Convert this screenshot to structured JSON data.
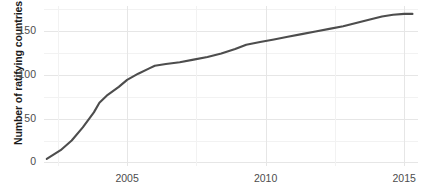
{
  "chart_data": {
    "type": "line",
    "title": "",
    "xlabel": "",
    "ylabel": "Number of ratifying countries",
    "xlim": [
      2002.0,
      2015.5
    ],
    "ylim": [
      -4,
      178
    ],
    "grid": true,
    "legend": "none",
    "line_color": "#4d4d4d",
    "x_ticks": [
      2005,
      2010,
      2015
    ],
    "x_tick_labels": [
      "2005",
      "2010",
      "2015"
    ],
    "x_minor_ticks": [
      2002.5,
      2007.5,
      2012.5
    ],
    "y_ticks": [
      0,
      50,
      100,
      150
    ],
    "y_tick_labels": [
      "0",
      "50",
      "100",
      "150"
    ],
    "y_minor_ticks": [
      25,
      75,
      125,
      175
    ],
    "series": [
      {
        "name": "Ratifying countries",
        "x": [
          2002.1,
          2002.6,
          2003.0,
          2003.4,
          2003.8,
          2004.0,
          2004.3,
          2004.7,
          2005.0,
          2005.4,
          2005.8,
          2006.0,
          2006.4,
          2006.9,
          2007.4,
          2007.9,
          2008.4,
          2008.9,
          2009.3,
          2009.8,
          2010.3,
          2010.8,
          2011.3,
          2011.8,
          2012.3,
          2012.8,
          2013.3,
          2013.8,
          2014.2,
          2014.6,
          2015.0,
          2015.3
        ],
        "y": [
          4,
          14,
          25,
          40,
          57,
          68,
          77,
          86,
          94,
          101,
          107,
          110,
          112,
          114,
          117,
          120,
          124,
          129,
          134,
          137,
          140,
          143,
          146,
          149,
          152,
          155,
          159,
          163,
          166,
          168,
          169,
          169
        ]
      }
    ]
  },
  "axis": {
    "y_title": "Number of ratifying countries"
  }
}
